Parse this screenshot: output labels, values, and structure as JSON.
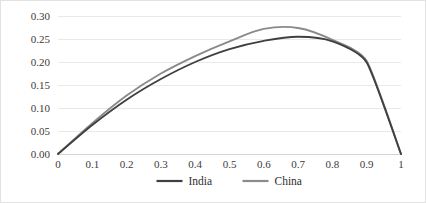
{
  "chart_data": {
    "type": "line",
    "title": "",
    "subtitle": "",
    "xlabel": "",
    "ylabel": "",
    "xlim": [
      0,
      1
    ],
    "ylim": [
      0,
      0.3
    ],
    "grid": true,
    "legend_position": "bottom",
    "x": [
      0,
      0.1,
      0.2,
      0.3,
      0.4,
      0.5,
      0.6,
      0.7,
      0.8,
      0.9,
      1
    ],
    "xticklabels": [
      "0",
      "0.1",
      "0.2",
      "0.3",
      "0.4",
      "0.5",
      "0.6",
      "0.7",
      "0.8",
      "0.9",
      "1"
    ],
    "yticks": [
      0.0,
      0.05,
      0.1,
      0.15,
      0.2,
      0.25,
      0.3
    ],
    "yticklabels": [
      "0.00",
      "0.05",
      "0.10",
      "0.15",
      "0.20",
      "0.25",
      "0.30"
    ],
    "series": [
      {
        "name": "India",
        "color": "#404040",
        "values": [
          0.0,
          0.063,
          0.118,
          0.163,
          0.2,
          0.228,
          0.246,
          0.255,
          0.245,
          0.199,
          0.0
        ]
      },
      {
        "name": "China",
        "color": "#8a8a8a",
        "values": [
          0.0,
          0.067,
          0.127,
          0.175,
          0.213,
          0.245,
          0.272,
          0.274,
          0.248,
          0.202,
          0.0
        ]
      }
    ]
  },
  "legend": {
    "items": [
      {
        "label": "India",
        "color": "#404040"
      },
      {
        "label": "China",
        "color": "#8a8a8a"
      }
    ]
  },
  "colors": {
    "india": "#404040",
    "china": "#8a8a8a",
    "gridline": "#e9e9e9",
    "axis": "#d6d6d6",
    "border": "#e2e2e2",
    "background": "#ffffff",
    "text": "#3b3b3b"
  }
}
